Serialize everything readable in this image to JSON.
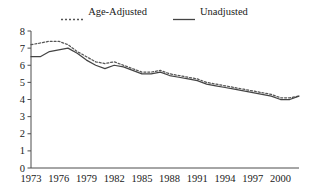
{
  "chart_data": {
    "type": "line",
    "title": "",
    "subtitle": "",
    "xlabel": "",
    "ylabel": "",
    "xlim": [
      1973,
      2002
    ],
    "ylim": [
      0,
      8
    ],
    "grid": false,
    "legend_position": "top-center",
    "y_ticks": [
      0,
      1,
      2,
      3,
      4,
      5,
      6,
      7,
      8
    ],
    "y_tick_labels": [
      "0",
      "1",
      "2",
      "3",
      "4",
      "5",
      "6",
      "7",
      "8"
    ],
    "x_ticks": [
      1973,
      1976,
      1979,
      1982,
      1985,
      1988,
      1991,
      1994,
      1997,
      2000
    ],
    "x_tick_labels": [
      "1973",
      "1976",
      "1979",
      "1982",
      "1985",
      "1988",
      "1991",
      "1994",
      "1997",
      "2000"
    ],
    "x": [
      1973,
      1974,
      1975,
      1976,
      1977,
      1978,
      1979,
      1980,
      1981,
      1982,
      1983,
      1984,
      1985,
      1986,
      1987,
      1988,
      1989,
      1990,
      1991,
      1992,
      1993,
      1994,
      1995,
      1996,
      1997,
      1998,
      1999,
      2000,
      2001,
      2002
    ],
    "series": [
      {
        "name": "Age-Adjusted",
        "style": "dotted",
        "color": "#555555",
        "values": [
          7.2,
          7.3,
          7.4,
          7.4,
          7.2,
          6.8,
          6.5,
          6.2,
          6.1,
          6.2,
          6.0,
          5.8,
          5.6,
          5.6,
          5.7,
          5.5,
          5.4,
          5.3,
          5.2,
          5.0,
          4.9,
          4.8,
          4.7,
          4.6,
          4.5,
          4.4,
          4.3,
          4.1,
          4.1,
          4.2
        ]
      },
      {
        "name": "Unadjusted",
        "style": "solid",
        "color": "#444444",
        "values": [
          6.5,
          6.5,
          6.8,
          6.9,
          7.0,
          6.7,
          6.3,
          6.0,
          5.8,
          6.0,
          5.9,
          5.7,
          5.5,
          5.5,
          5.6,
          5.4,
          5.3,
          5.2,
          5.1,
          4.9,
          4.8,
          4.7,
          4.6,
          4.5,
          4.4,
          4.3,
          4.2,
          4.0,
          4.0,
          4.2
        ]
      }
    ]
  },
  "legend": {
    "items": [
      {
        "label": "Age-Adjusted",
        "style": "dotted"
      },
      {
        "label": "Unadjusted",
        "style": "solid"
      }
    ]
  },
  "colors": {
    "axis": "#4d4d4d",
    "text": "#1a1a1a",
    "age_adjusted": "#555555",
    "unadjusted": "#444444",
    "background": "#ffffff"
  }
}
